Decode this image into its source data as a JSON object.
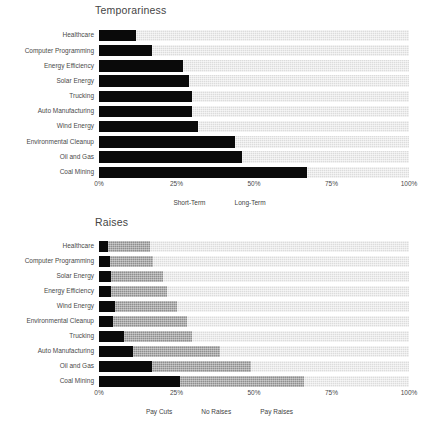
{
  "chart_data": [
    {
      "type": "bar",
      "orientation": "horizontal",
      "stacked": true,
      "normalized": true,
      "title": "Temporariness",
      "xlabel": "",
      "ylabel": "",
      "xlim": [
        0,
        100
      ],
      "xticks": [
        0,
        25,
        50,
        75,
        100
      ],
      "xticklabels": [
        "0%",
        "25%",
        "50%",
        "75%",
        "100%"
      ],
      "grid": false,
      "legend_position": "bottom",
      "categories": [
        "Healthcare",
        "Computer Programming",
        "Energy Efficiency",
        "Solar Energy",
        "Trucking",
        "Auto Manufacturing",
        "Wind Energy",
        "Environmental Cleanup",
        "Oil and Gas",
        "Coal Mining"
      ],
      "series": [
        {
          "name": "Short-Term",
          "color": "#0a0a0a",
          "values": [
            12,
            17,
            27,
            29,
            30,
            30,
            32,
            44,
            46,
            67
          ]
        },
        {
          "name": "Long-Term",
          "color": "#dcdcdc",
          "values": [
            88,
            83,
            73,
            71,
            70,
            70,
            68,
            56,
            54,
            33
          ]
        }
      ]
    },
    {
      "type": "bar",
      "orientation": "horizontal",
      "stacked": true,
      "normalized": true,
      "title": "Raises",
      "xlabel": "",
      "ylabel": "",
      "xlim": [
        0,
        100
      ],
      "xticks": [
        0,
        25,
        50,
        75,
        100
      ],
      "xticklabels": [
        "0%",
        "25%",
        "50%",
        "75%",
        "100%"
      ],
      "grid": false,
      "legend_position": "bottom",
      "categories": [
        "Healthcare",
        "Computer Programming",
        "Solar Energy",
        "Energy Efficiency",
        "Wind Energy",
        "Environmental Cleanup",
        "Trucking",
        "Auto Manufacturing",
        "Oil and Gas",
        "Coal Mining"
      ],
      "series": [
        {
          "name": "Pay Cuts",
          "color": "#0a0a0a",
          "values": [
            3,
            3.5,
            4,
            4,
            5,
            4.5,
            8,
            11,
            17,
            26
          ]
        },
        {
          "name": "No Raises",
          "color": "#8e8e8e",
          "values": [
            13.5,
            14,
            16.5,
            18,
            20,
            24,
            22,
            28,
            32,
            40
          ]
        },
        {
          "name": "Pay Raises",
          "color": "#dcdcdc",
          "values": [
            83.5,
            82.5,
            79.5,
            78,
            75,
            71.5,
            70,
            61,
            51,
            34
          ]
        }
      ]
    }
  ]
}
